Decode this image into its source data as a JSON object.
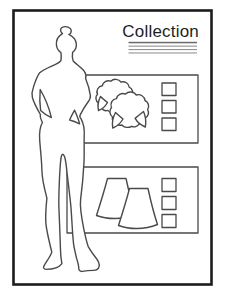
{
  "window": {
    "background": "#ffffff",
    "frame_color": "#1c1c1c",
    "line_color": "#4a4a4a",
    "text_color": "#1e1e1e",
    "rule_dark": "#6a6a6a",
    "rule_light": "#939393"
  },
  "header": {
    "title": "Collection",
    "underline_count": 4
  },
  "figure": {
    "label": "fashion-model-silhouette"
  },
  "panels": [
    {
      "id": "tops",
      "items": [
        {
          "label": "puff-sleeve-top"
        },
        {
          "label": "puff-sleeve-top"
        }
      ],
      "checkboxes": [
        {
          "checked": false
        },
        {
          "checked": false
        },
        {
          "checked": false
        }
      ]
    },
    {
      "id": "skirts",
      "items": [
        {
          "label": "a-line-skirt"
        },
        {
          "label": "a-line-skirt"
        }
      ],
      "checkboxes": [
        {
          "checked": false
        },
        {
          "checked": false
        },
        {
          "checked": false
        }
      ]
    }
  ]
}
